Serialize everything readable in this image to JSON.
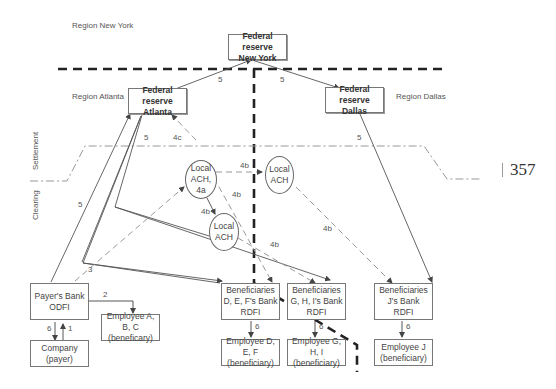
{
  "regions": {
    "new_york": "Region New York",
    "atlanta": "Region Atlanta",
    "dallas": "Region Dallas"
  },
  "layers": {
    "settlement": "Settlement",
    "clearing": "Clearing"
  },
  "nodes": {
    "fr_ny": [
      "Federal reserve",
      "New York"
    ],
    "fr_atlanta": [
      "Federal reserve",
      "Atlanta"
    ],
    "fr_dallas": [
      "Federal reserve",
      "Dallas"
    ],
    "local_ach_4a": [
      "Local",
      "ACH, 4a"
    ],
    "local_ach_right": [
      "Local",
      "ACH"
    ],
    "local_ach_lower": [
      "Local",
      "ACH"
    ],
    "payers_bank": [
      "Payer's Bank",
      "ODFI"
    ],
    "employee_abc": [
      "Employee A, B, C",
      "(beneficary)"
    ],
    "company": [
      "Company",
      "(payer)"
    ],
    "bank_def": [
      "Beneficiaries",
      "D, E, F's Bank",
      "RDFI"
    ],
    "bank_ghi": [
      "Beneficiaries",
      "G, H, I's Bank",
      "RDFI"
    ],
    "bank_j": [
      "Beneficiaries",
      "J's Bank",
      "RDFI"
    ],
    "employee_def": [
      "Employee D, E, F",
      "(beneficiary)"
    ],
    "employee_ghi": [
      "Employee G, H, I",
      "(beneficiary)"
    ],
    "employee_j": [
      "Employee J",
      "(beneficiary)"
    ]
  },
  "edge_labels": {
    "ny_atl": "5",
    "ny_dal": "5",
    "atl_settle": "5",
    "atl_left": "5",
    "dal_settle": "5",
    "ach_4c": "4c",
    "ach_right_4b": "4b",
    "ach_diag_4b": "4b",
    "ach_down_4b": "4b",
    "ach_lower_4b": "4b",
    "ach_right_down_4b": "4b",
    "step3": "3",
    "step2": "2",
    "company_6": "6",
    "company_1": "1",
    "def_6": "6",
    "ghi_6": "6",
    "j_6": "6"
  },
  "page_number": "357"
}
